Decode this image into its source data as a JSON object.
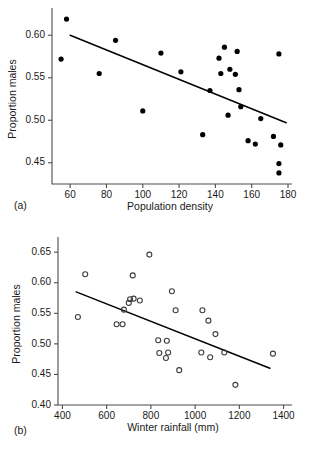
{
  "figure": {
    "panel_a_tag": "(a)",
    "panel_b_tag": "(b)"
  },
  "chart_data": [
    {
      "type": "scatter",
      "panel": "(a)",
      "title": "",
      "xlabel": "Population density",
      "ylabel": "Proportion males",
      "xlim": [
        50,
        180
      ],
      "ylim": [
        0.425,
        0.625
      ],
      "xticks": [
        60,
        80,
        100,
        120,
        140,
        160,
        180
      ],
      "yticks": [
        0.45,
        0.5,
        0.55,
        0.6
      ],
      "xticklabels": [
        "60",
        "80",
        "100",
        "120",
        "140",
        "160",
        "180"
      ],
      "yticklabels": [
        "0.45",
        "0.50",
        "0.55",
        "0.60"
      ],
      "grid": false,
      "legend": "none",
      "marker": "filled-circle",
      "points": [
        {
          "x": 58,
          "y": 0.619
        },
        {
          "x": 55,
          "y": 0.572
        },
        {
          "x": 76,
          "y": 0.555
        },
        {
          "x": 85,
          "y": 0.594
        },
        {
          "x": 100,
          "y": 0.511
        },
        {
          "x": 110,
          "y": 0.579
        },
        {
          "x": 121,
          "y": 0.557
        },
        {
          "x": 133,
          "y": 0.483
        },
        {
          "x": 137,
          "y": 0.535
        },
        {
          "x": 142,
          "y": 0.573
        },
        {
          "x": 143,
          "y": 0.555
        },
        {
          "x": 145,
          "y": 0.586
        },
        {
          "x": 147,
          "y": 0.506
        },
        {
          "x": 148,
          "y": 0.56
        },
        {
          "x": 151,
          "y": 0.554
        },
        {
          "x": 152,
          "y": 0.581
        },
        {
          "x": 153,
          "y": 0.536
        },
        {
          "x": 154,
          "y": 0.516
        },
        {
          "x": 158,
          "y": 0.476
        },
        {
          "x": 162,
          "y": 0.472
        },
        {
          "x": 165,
          "y": 0.502
        },
        {
          "x": 172,
          "y": 0.481
        },
        {
          "x": 175,
          "y": 0.578
        },
        {
          "x": 176,
          "y": 0.471
        },
        {
          "x": 175,
          "y": 0.449
        },
        {
          "x": 175,
          "y": 0.438
        }
      ],
      "fit_line": {
        "x0": 60,
        "y0": 0.6,
        "x1": 179,
        "y1": 0.497
      }
    },
    {
      "type": "scatter",
      "panel": "(b)",
      "title": "",
      "xlabel": "Winter rainfall (mm)",
      "ylabel": "Proportion males",
      "xlim": [
        380,
        1420
      ],
      "ylim": [
        0.4,
        0.665
      ],
      "xticks": [
        400,
        600,
        800,
        1000,
        1200,
        1400
      ],
      "yticks": [
        0.4,
        0.45,
        0.5,
        0.55,
        0.6,
        0.65
      ],
      "xticklabels": [
        "400",
        "600",
        "800",
        "1000",
        "1200",
        "1400"
      ],
      "yticklabels": [
        "0.40",
        "0.45",
        "0.50",
        "0.55",
        "0.60",
        "0.65"
      ],
      "grid": false,
      "legend": "none",
      "marker": "open-circle",
      "points": [
        {
          "x": 470,
          "y": 0.544
        },
        {
          "x": 503,
          "y": 0.614
        },
        {
          "x": 645,
          "y": 0.532
        },
        {
          "x": 672,
          "y": 0.532
        },
        {
          "x": 678,
          "y": 0.556
        },
        {
          "x": 700,
          "y": 0.567
        },
        {
          "x": 706,
          "y": 0.573
        },
        {
          "x": 718,
          "y": 0.612
        },
        {
          "x": 722,
          "y": 0.574
        },
        {
          "x": 750,
          "y": 0.571
        },
        {
          "x": 793,
          "y": 0.646
        },
        {
          "x": 833,
          "y": 0.506
        },
        {
          "x": 838,
          "y": 0.485
        },
        {
          "x": 868,
          "y": 0.477
        },
        {
          "x": 872,
          "y": 0.505
        },
        {
          "x": 878,
          "y": 0.486
        },
        {
          "x": 895,
          "y": 0.586
        },
        {
          "x": 912,
          "y": 0.555
        },
        {
          "x": 928,
          "y": 0.457
        },
        {
          "x": 1028,
          "y": 0.486
        },
        {
          "x": 1033,
          "y": 0.555
        },
        {
          "x": 1060,
          "y": 0.538
        },
        {
          "x": 1068,
          "y": 0.478
        },
        {
          "x": 1092,
          "y": 0.516
        },
        {
          "x": 1132,
          "y": 0.486
        },
        {
          "x": 1182,
          "y": 0.433
        },
        {
          "x": 1352,
          "y": 0.484
        }
      ],
      "fit_line": {
        "x0": 462,
        "y0": 0.585,
        "x1": 1338,
        "y1": 0.46
      }
    }
  ]
}
